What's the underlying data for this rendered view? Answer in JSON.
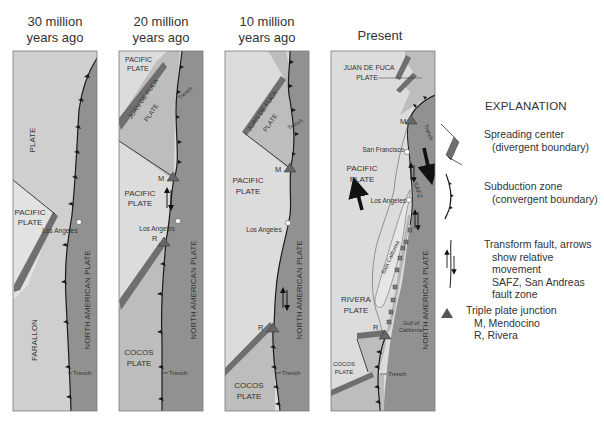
{
  "figure": {
    "panels": [
      {
        "id": "30ma",
        "title_line1": "30 million",
        "title_line2": "years ago",
        "labels": {
          "plate_top": "PLATE",
          "pacific_1": "PACIFIC",
          "pacific_2": "PLATE",
          "city": "Los Angeles",
          "north_american": "NORTH AMERICAN PLATE",
          "farallon": "FARALLON",
          "trench": "Trench"
        }
      },
      {
        "id": "20ma",
        "title_line1": "20 million",
        "title_line2": "years ago",
        "labels": {
          "pacific_top_1": "PACIFIC",
          "pacific_top_2": "PLATE",
          "juan_de_fuca": "JUAN DE FUCA",
          "plate": "PLATE",
          "trench_top": "Trench",
          "junction_m": "M",
          "pacific_1": "PACIFIC",
          "pacific_2": "PLATE",
          "city": "Los Angeles",
          "junction_r": "R",
          "north_american": "NORTH AMERICAN PLATE",
          "cocos_1": "COCOS",
          "cocos_2": "PLATE",
          "trench": "Trench"
        }
      },
      {
        "id": "10ma",
        "title_line1": "10 million",
        "title_line2": "years ago",
        "labels": {
          "juan_de_fuca": "JUAN DE FUCA",
          "plate": "PLATE",
          "trench_top": "Trench",
          "junction_m": "M",
          "pacific_1": "PACIFIC",
          "pacific_2": "PLATE",
          "city": "Los Angeles",
          "junction_r": "R",
          "north_american": "NORTH AMERICAN PLATE",
          "cocos_1": "COCOS",
          "cocos_2": "PLATE",
          "trench": "Trench"
        }
      },
      {
        "id": "present",
        "title_line1": "Present",
        "labels": {
          "juan_de_fuca_1": "JUAN DE FUCA",
          "juan_de_fuca_2": "PLATE",
          "trench_top": "Trench",
          "junction_m": "M",
          "city_sf": "San Francisco",
          "pacific_1": "PACIFIC",
          "pacific_2": "PLATE",
          "safz": "SAFZ",
          "city_la": "Los Angeles",
          "baja": "Baja California",
          "north_american": "NORTH AMERICAN PLATE",
          "rivera_1": "RIVERA",
          "rivera_2": "PLATE",
          "junction_r": "R",
          "gulf_1": "Gulf of",
          "gulf_2": "California",
          "cocos_1": "COCOS",
          "cocos_2": "PLATE",
          "trench": "Trench"
        }
      }
    ],
    "legend": {
      "heading": "EXPLANATION",
      "items": [
        {
          "icon": "spreading-center-icon",
          "line1": "Spreading center",
          "line2": "(divergent boundary)"
        },
        {
          "icon": "subduction-zone-icon",
          "line1": "Subduction zone",
          "line2": "(convergent boundary)"
        },
        {
          "icon": "transform-fault-icon",
          "line1": "Transform fault, arrows",
          "line2": "show relative movement",
          "line3": "SAFZ, San Andreas",
          "line4": "fault zone"
        },
        {
          "icon": "triple-junction-icon",
          "line1": "Triple plate junction",
          "line2": "M, Mendocino",
          "line3": "R, Rivera"
        }
      ]
    },
    "colors": {
      "light_plate": "#dcdcdc",
      "mid_plate": "#bdbdbd",
      "north_american_plate": "#8f8f8f",
      "ridge": "#6f6f6f",
      "boundary_line": "#1a1a1a",
      "border": "#7a7a7a"
    }
  }
}
